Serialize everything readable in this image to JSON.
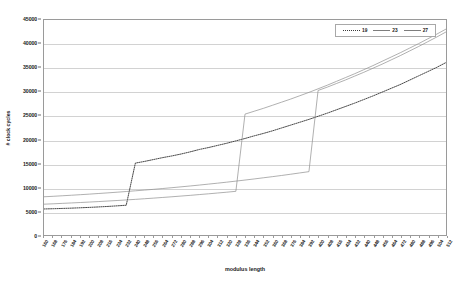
{
  "chart_data": {
    "type": "line",
    "title": "",
    "xlabel": "modulus length",
    "ylabel": "# clock cycles",
    "ylim": [
      0,
      45000
    ],
    "ytick_step": 5000,
    "yticks": [
      0,
      5000,
      10000,
      15000,
      20000,
      25000,
      30000,
      35000,
      40000,
      45000
    ],
    "grid": true,
    "legend_position": "top-right",
    "categories": [
      "160",
      "168",
      "176",
      "184",
      "192",
      "200",
      "208",
      "216",
      "224",
      "232",
      "240",
      "248",
      "256",
      "264",
      "272",
      "280",
      "288",
      "296",
      "304",
      "312",
      "320",
      "328",
      "336",
      "344",
      "352",
      "360",
      "368",
      "376",
      "384",
      "392",
      "400",
      "408",
      "416",
      "424",
      "432",
      "440",
      "448",
      "456",
      "464",
      "472",
      "480",
      "488",
      "496",
      "504",
      "512"
    ],
    "series": [
      {
        "name": "19",
        "style": "dotted",
        "color": "#333333",
        "values": [
          5450,
          5500,
          5560,
          5620,
          5700,
          5780,
          5880,
          5980,
          6100,
          6230,
          15050,
          15400,
          15800,
          16200,
          16550,
          16950,
          17400,
          17900,
          18300,
          18750,
          19200,
          19700,
          20200,
          20750,
          21250,
          21800,
          22400,
          23000,
          23600,
          24200,
          24850,
          25500,
          26200,
          26900,
          27600,
          28350,
          29100,
          29900,
          30700,
          31500,
          32400,
          33300,
          34200,
          35100,
          36100
        ]
      },
      {
        "name": "23",
        "style": "solid",
        "color": "#8c8c8c",
        "values": [
          6450,
          6530,
          6620,
          6710,
          6800,
          6900,
          7000,
          7110,
          7220,
          7340,
          7460,
          7590,
          7720,
          7860,
          8000,
          8150,
          8300,
          8460,
          8620,
          8790,
          8960,
          9140,
          25300,
          25900,
          26500,
          27150,
          27800,
          28450,
          29150,
          29850,
          30600,
          31350,
          32150,
          32950,
          33750,
          34600,
          35450,
          36350,
          37250,
          38150,
          39100,
          40050,
          41050,
          42050,
          43100
        ]
      },
      {
        "name": "27",
        "style": "solid",
        "color": "#8c8c8c",
        "values": [
          8000,
          8100,
          8210,
          8320,
          8440,
          8560,
          8690,
          8820,
          8960,
          9100,
          9250,
          9400,
          9560,
          9730,
          9900,
          10080,
          10260,
          10450,
          10650,
          10850,
          11060,
          11280,
          11500,
          11730,
          11970,
          12210,
          12460,
          12720,
          12990,
          13260,
          30250,
          30950,
          31700,
          32450,
          33250,
          34050,
          34900,
          35750,
          36650,
          37550,
          38500,
          39450,
          40450,
          41450,
          42500
        ]
      }
    ]
  },
  "legend": {
    "entries": [
      {
        "label": "19",
        "style": "dotted"
      },
      {
        "label": "23",
        "style": "solid"
      },
      {
        "label": "27",
        "style": "solid"
      }
    ]
  }
}
